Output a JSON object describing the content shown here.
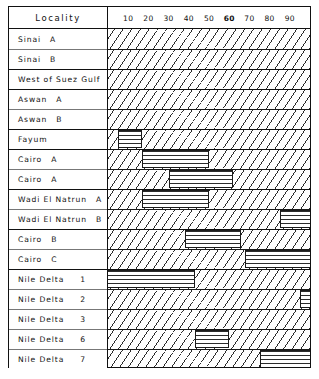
{
  "header": {
    "locality_label": "Locality"
  },
  "axis": {
    "ticks": [
      "10",
      "20",
      "30",
      "40",
      "50",
      "60",
      "70",
      "80",
      "90"
    ],
    "tick_values": [
      10,
      20,
      30,
      40,
      50,
      60,
      70,
      80,
      90
    ],
    "bold_tick": "60",
    "min": 0,
    "max": 100
  },
  "colors": {
    "ink": "#111111",
    "hatch": "#2b2b2b",
    "background": "#ffffff"
  },
  "chart_data": {
    "type": "bar",
    "title": "",
    "xlabel": "",
    "ylabel": "Locality",
    "xlim": [
      0,
      100
    ],
    "grid": false,
    "legend": "none",
    "orientation": "horizontal",
    "note": "Each row shows a horizontally-hatched range bar over a diagonally-hatched band; rows with no bar have no range marked.",
    "categories": [
      "Sinai  A",
      "Sinai  B",
      "West of Suez Gulf",
      "Aswan  A",
      "Aswan  B",
      "Fayum",
      "Cairo  A",
      "Cairo  A",
      "Wadi El Natrun  A",
      "Wadi El Natrun  B",
      "Cairo  B",
      "Cairo  C",
      "Nile  Delta   1",
      "Nile  Delta   2",
      "Nile  Delta   3",
      "Nile  Delta   6",
      "Nile  Delta   7"
    ],
    "ranges": [
      null,
      null,
      null,
      null,
      null,
      [
        5,
        17
      ],
      [
        17,
        50
      ],
      [
        30,
        62
      ],
      [
        17,
        50
      ],
      [
        85,
        100
      ],
      [
        38,
        66
      ],
      [
        68,
        100
      ],
      [
        0,
        43
      ],
      [
        95,
        100
      ],
      null,
      [
        43,
        60
      ],
      [
        75,
        100
      ]
    ]
  },
  "rows": [
    {
      "name": "Sinai  A",
      "prefix": "Sinai",
      "suffix": "A",
      "num": "",
      "group_start": true
    },
    {
      "name": "Sinai  B",
      "prefix": "Sinai",
      "suffix": "B",
      "num": "",
      "group_start": false
    },
    {
      "name": "West of Suez Gulf",
      "prefix": "West of Suez Gulf",
      "suffix": "",
      "num": "",
      "group_start": true
    },
    {
      "name": "Aswan  A",
      "prefix": "Aswan",
      "suffix": "A",
      "num": "",
      "group_start": true
    },
    {
      "name": "Aswan  B",
      "prefix": "Aswan",
      "suffix": "B",
      "num": "",
      "group_start": false
    },
    {
      "name": "Fayum",
      "prefix": "Fayum",
      "suffix": "",
      "num": "",
      "group_start": true
    },
    {
      "name": "Cairo  A",
      "prefix": "Cairo",
      "suffix": "A",
      "num": "",
      "group_start": true
    },
    {
      "name": "Cairo  A",
      "prefix": "Cairo",
      "suffix": "A",
      "num": "",
      "group_start": false
    },
    {
      "name": "Wadi El Natrun  A",
      "prefix": "Wadi El Natrun",
      "suffix": "A",
      "num": "",
      "group_start": true
    },
    {
      "name": "Wadi El Natrun  B",
      "prefix": "Wadi El Natrun",
      "suffix": "B",
      "num": "",
      "group_start": false
    },
    {
      "name": "Cairo  B",
      "prefix": "Cairo",
      "suffix": "B",
      "num": "",
      "group_start": true
    },
    {
      "name": "Cairo  C",
      "prefix": "Cairo",
      "suffix": "C",
      "num": "",
      "group_start": false
    },
    {
      "name": "Nile  Delta   1",
      "prefix": "Nile  Delta",
      "suffix": "",
      "num": "1",
      "group_start": true
    },
    {
      "name": "Nile  Delta   2",
      "prefix": "Nile  Delta",
      "suffix": "",
      "num": "2",
      "group_start": false
    },
    {
      "name": "Nile  Delta   3",
      "prefix": "Nile  Delta",
      "suffix": "",
      "num": "3",
      "group_start": false
    },
    {
      "name": "Nile  Delta   6",
      "prefix": "Nile  Delta",
      "suffix": "",
      "num": "6",
      "group_start": false
    },
    {
      "name": "Nile  Delta   7",
      "prefix": "Nile  Delta",
      "suffix": "",
      "num": "7",
      "group_start": false
    }
  ]
}
